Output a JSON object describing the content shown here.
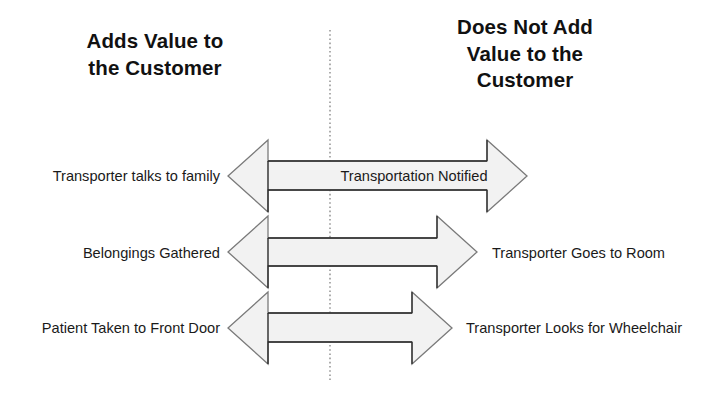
{
  "diagram": {
    "headings": {
      "left": "Adds Value to\nthe Customer",
      "right": "Does Not Add\nValue to the\nCustomer"
    },
    "divider": {
      "style": "dashed-vertical",
      "color": "#8a8a8a"
    },
    "arrow_style": {
      "fill": "#f2f2f2",
      "stroke": "#6b6b6b",
      "shaft_stroke": "#2b2b2b"
    },
    "rows": [
      {
        "id": "row-1",
        "left_label": "Transporter talks to family",
        "shaft_label": "Transportation Notified",
        "right_label": ""
      },
      {
        "id": "row-2",
        "left_label": "Belongings Gathered",
        "shaft_label": "",
        "right_label": "Transporter Goes to Room"
      },
      {
        "id": "row-3",
        "left_label": "Patient Taken to Front Door",
        "shaft_label": "",
        "right_label": "Transporter Looks for Wheelchair"
      }
    ]
  }
}
